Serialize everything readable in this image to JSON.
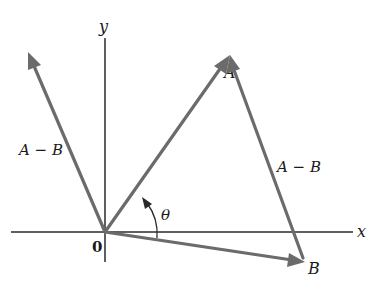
{
  "figure": {
    "axes": {
      "x_label": "x",
      "y_label": "y",
      "origin_label": "0"
    },
    "vectors": {
      "A": {
        "label": "A"
      },
      "B": {
        "label": "B"
      },
      "diff_from_origin": {
        "label": "A − B"
      },
      "diff_from_B": {
        "label": "A − B"
      }
    },
    "angle": {
      "label": "θ"
    },
    "colors": {
      "vector": "#6b6b6b",
      "axis": "#2a2a2a",
      "text": "#1a1a1a",
      "background": "#ffffff"
    }
  }
}
